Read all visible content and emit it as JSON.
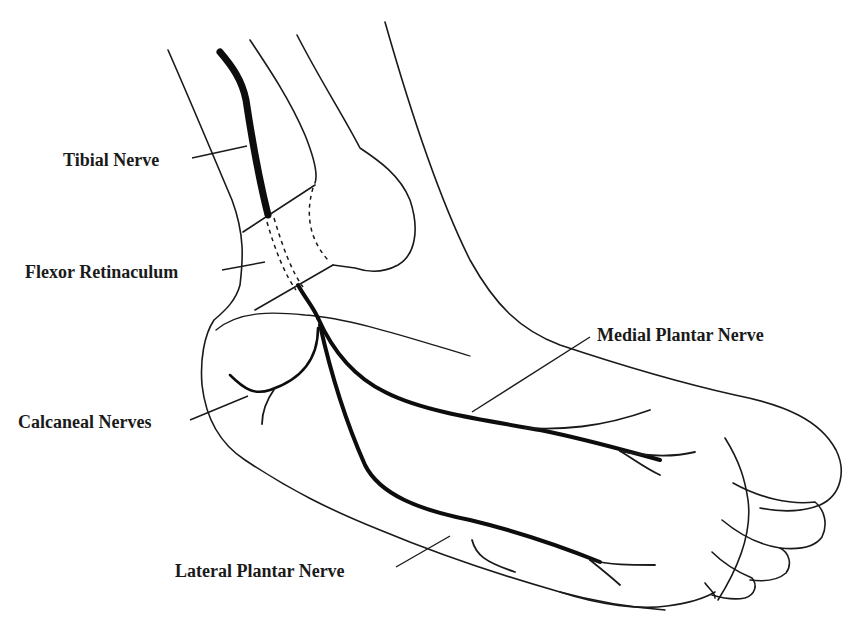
{
  "figure": {
    "labels": [
      {
        "id": "tibial-nerve",
        "text": "Tibial Nerve"
      },
      {
        "id": "flexor-retinaculum",
        "text": "Flexor Retinaculum"
      },
      {
        "id": "calcaneal-nerves",
        "text": "Calcaneal Nerves"
      },
      {
        "id": "medial-plantar-nerve",
        "text": "Medial Plantar Nerve"
      },
      {
        "id": "lateral-plantar-nerve",
        "text": "Lateral Plantar Nerve"
      }
    ],
    "colors": {
      "line": "#1a1a1a",
      "nerve": "#0d0d0d",
      "background": "#ffffff"
    }
  }
}
